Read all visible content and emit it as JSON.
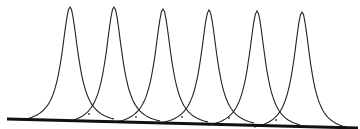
{
  "diagram": {
    "type": "overlapping-peaks",
    "colors": {
      "stroke": "#222222",
      "baseline": "#111111",
      "background": "#ffffff"
    },
    "baseline": {
      "x1": 7,
      "y1": 119,
      "x2": 358,
      "y2": 128
    },
    "peaks": [
      {
        "center_x": 70,
        "top_y": 7,
        "left_foot_x": 26,
        "right_foot_x": 114,
        "base_y": 119
      },
      {
        "center_x": 114,
        "top_y": 7,
        "left_foot_x": 70,
        "right_foot_x": 160,
        "base_y": 121
      },
      {
        "center_x": 163,
        "top_y": 9,
        "left_foot_x": 116,
        "right_foot_x": 208,
        "base_y": 122
      },
      {
        "center_x": 209,
        "top_y": 10,
        "left_foot_x": 160,
        "right_foot_x": 254,
        "base_y": 123
      },
      {
        "center_x": 257,
        "top_y": 11,
        "left_foot_x": 208,
        "right_foot_x": 300,
        "base_y": 125
      },
      {
        "center_x": 302,
        "top_y": 12,
        "left_foot_x": 254,
        "right_foot_x": 346,
        "base_y": 127
      }
    ],
    "dots": [
      {
        "x": 89,
        "y": 114
      },
      {
        "x": 136,
        "y": 117
      },
      {
        "x": 182,
        "y": 117
      },
      {
        "x": 229,
        "y": 118
      },
      {
        "x": 276,
        "y": 120
      }
    ]
  }
}
